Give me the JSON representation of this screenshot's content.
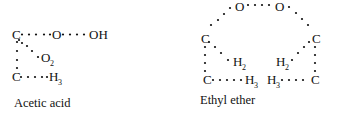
{
  "colors": {
    "ink": "#111111",
    "background": "#ffffff"
  },
  "molecules": [
    {
      "name": "Acetic acid",
      "atoms": {
        "c1": "C",
        "o_bridge": "O",
        "oh": "OH",
        "o2": "O",
        "o2_sub": "2",
        "c2": "C",
        "h3": "H",
        "h3_sub": "3"
      }
    },
    {
      "name": "Ethyl ether",
      "atoms": {
        "o_left": "O",
        "o_right": "O",
        "c_left": "C",
        "c_right": "C",
        "h2_left": "H",
        "h2_left_sub": "2",
        "h2_right": "H",
        "h2_right_sub": "2",
        "c_bottom_left": "C",
        "h3_left": "H",
        "h3_left_sub": "3",
        "h3_right": "H",
        "h3_right_sub": "3",
        "c_bottom_right": "C"
      }
    }
  ]
}
